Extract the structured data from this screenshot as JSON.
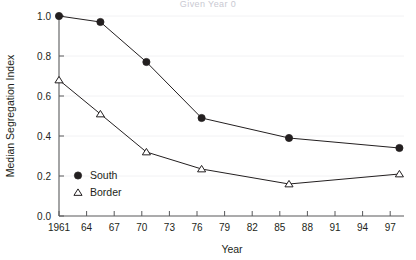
{
  "chart_data": {
    "type": "line",
    "title": "Given Year 0",
    "xlabel": "Year",
    "ylabel": "Median Segregation Index",
    "xlim": [
      1961,
      1998.5
    ],
    "ylim": [
      0.0,
      1.0
    ],
    "grid": "faint-horizontal",
    "legend_position": "inside-lower-left",
    "x": [
      1961,
      1965.5,
      1970.5,
      1976.5,
      1986,
      1998
    ],
    "xtick_values": [
      1961,
      1964,
      1967,
      1970,
      1973,
      1976,
      1979,
      1982,
      1985,
      1988,
      1991,
      1994,
      1997
    ],
    "xtick_labels": [
      "1961",
      "64",
      "67",
      "70",
      "73",
      "76",
      "79",
      "82",
      "85",
      "88",
      "91",
      "94",
      "97"
    ],
    "ytick_values": [
      0.0,
      0.2,
      0.4,
      0.6,
      0.8,
      1.0
    ],
    "ytick_labels": [
      "0.0",
      "0.2",
      "0.4",
      "0.6",
      "0.8",
      "1.0"
    ],
    "series": [
      {
        "name": "South",
        "marker": "filled-circle",
        "values": [
          1.0,
          0.97,
          0.77,
          0.49,
          0.39,
          0.34
        ]
      },
      {
        "name": "Border",
        "marker": "open-triangle",
        "values": [
          0.68,
          0.51,
          0.32,
          0.235,
          0.16,
          0.21
        ]
      }
    ]
  },
  "legend": {
    "entries": [
      {
        "label": "South",
        "marker": "filled-circle"
      },
      {
        "label": "Border",
        "marker": "open-triangle"
      }
    ]
  },
  "colors": {
    "ink": "#231f20",
    "axis": "#58595b",
    "guide": "#f2f2f4",
    "title_faint": "#c9c9d2",
    "background": "#ffffff"
  }
}
